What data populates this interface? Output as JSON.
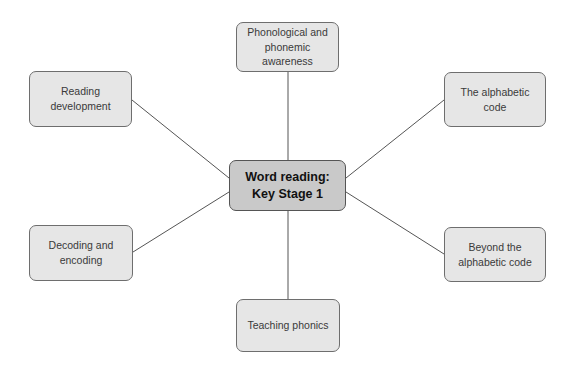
{
  "diagram": {
    "type": "mind-map",
    "center": {
      "label": "Word reading:\nKey Stage 1"
    },
    "branches": [
      {
        "id": "phonological",
        "label": "Phonological and\nphonemic\nawareness",
        "position": "top"
      },
      {
        "id": "reading-development",
        "label": "Reading\ndevelopment",
        "position": "top-left"
      },
      {
        "id": "alphabetic-code",
        "label": "The alphabetic\ncode",
        "position": "top-right"
      },
      {
        "id": "decoding-encoding",
        "label": "Decoding and\nencoding",
        "position": "bottom-left"
      },
      {
        "id": "beyond-alphabetic",
        "label": "Beyond the\nalphabetic code",
        "position": "bottom-right"
      },
      {
        "id": "teaching-phonics",
        "label": "Teaching phonics",
        "position": "bottom"
      }
    ],
    "colors": {
      "node_fill": "#e6e6e6",
      "center_fill": "#c9c9c9",
      "border": "#6e6e6e",
      "connector": "#555555"
    }
  }
}
